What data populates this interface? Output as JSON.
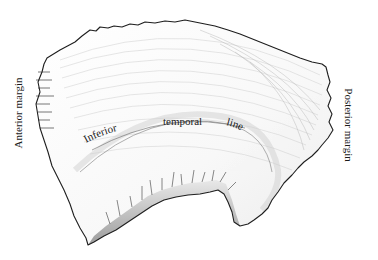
{
  "figure": {
    "colors": {
      "background": "#ffffff",
      "bone_fill": "#fbfbfb",
      "outline": "#1e1e1e",
      "shading": "#8a8a8a",
      "label_text": "#1a1a1a"
    }
  },
  "labels": {
    "anterior_margin": "Anterior margin",
    "posterior_margin": "Posterior margin",
    "inferior_temporal_line": {
      "word1": "Inferior",
      "word2": "temporal",
      "word3": "line"
    }
  }
}
